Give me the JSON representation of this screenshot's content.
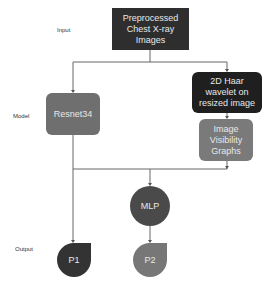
{
  "stage_labels": {
    "input": "Input",
    "model": "Model",
    "output": "Output"
  },
  "nodes": {
    "input_images": {
      "label": "Preprocessed Chest X-ray Images",
      "color": "#2e2e2e"
    },
    "resnet": {
      "label": "Resnet34",
      "color": "#6f6f6f"
    },
    "haar": {
      "label": "2D Haar wavelet on resized image",
      "color": "#1f1f1f"
    },
    "ivg": {
      "label": "Image Visibility Graphs",
      "color": "#7a7a7a"
    },
    "mlp": {
      "label": "MLP",
      "color": "#4a4a4a"
    },
    "p1": {
      "label": "P1",
      "color": "#333333"
    },
    "p2": {
      "label": "P2",
      "color": "#777777"
    }
  },
  "edges": [
    {
      "from": "input_images",
      "to": "resnet"
    },
    {
      "from": "input_images",
      "to": "haar"
    },
    {
      "from": "haar",
      "to": "ivg"
    },
    {
      "from": "resnet",
      "to": "p1"
    },
    {
      "from": "resnet",
      "to": "mlp"
    },
    {
      "from": "ivg",
      "to": "mlp"
    },
    {
      "from": "mlp",
      "to": "p2"
    }
  ]
}
